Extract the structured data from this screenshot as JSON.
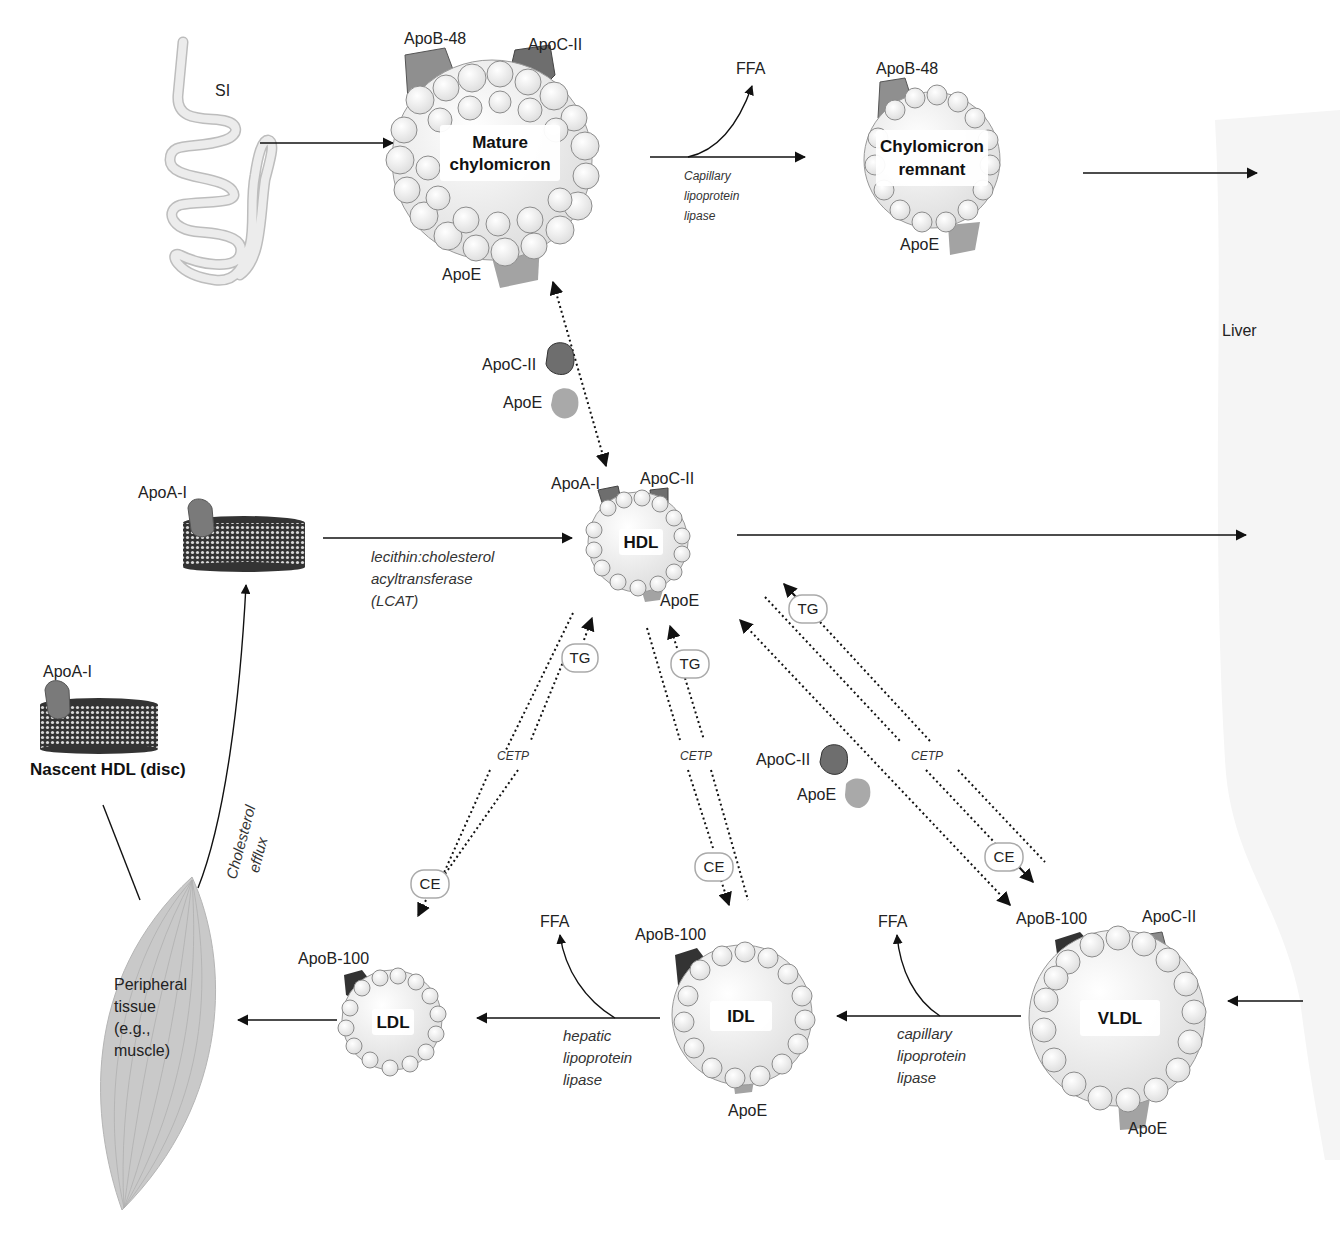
{
  "organs": {
    "small_intestine": "SI",
    "liver": "Liver",
    "peripheral_tissue": [
      "Peripheral",
      "tissue",
      "(e.g.,",
      "muscle)"
    ]
  },
  "particles": {
    "mature_chylomicron": {
      "title": [
        "Mature",
        "chylomicron"
      ],
      "apo_b": "ApoB-48",
      "apo_c": "ApoC-II",
      "apo_e": "ApoE"
    },
    "chylomicron_remnant": {
      "title": [
        "Chylomicron",
        "remnant"
      ],
      "apo_b": "ApoB-48",
      "apo_e": "ApoE"
    },
    "hdl": {
      "title": "HDL",
      "apo_a": "ApoA-I",
      "apo_c": "ApoC-II",
      "apo_e": "ApoE"
    },
    "nascent_hdl": {
      "title": "Nascent HDL (disc)",
      "apo_a": "ApoA-I"
    },
    "disc_hdl_upper": {
      "apo_a": "ApoA-I"
    },
    "ldl": {
      "title": "LDL",
      "apo_b": "ApoB-100"
    },
    "idl": {
      "title": "IDL",
      "apo_b": "ApoB-100",
      "apo_e": "ApoE"
    },
    "vldl": {
      "title": "VLDL",
      "apo_b": "ApoB-100",
      "apo_c": "ApoC-II",
      "apo_e": "ApoE"
    }
  },
  "free_apos": {
    "upper": {
      "apo_c": "ApoC-II",
      "apo_e": "ApoE"
    },
    "lower": {
      "apo_c": "ApoC-II",
      "apo_e": "ApoE"
    }
  },
  "enzymes": {
    "capillary_lpl_top": [
      "Capillary",
      "lipoprotein",
      "lipase"
    ],
    "lcat": [
      "lecithin:cholesterol",
      "acyltransferase",
      "(LCAT)"
    ],
    "hepatic_lpl": [
      "hepatic",
      "lipoprotein",
      "lipase"
    ],
    "capillary_lpl_bottom": [
      "capillary",
      "lipoprotein",
      "lipase"
    ],
    "cetp": "CETP",
    "cholesterol_efflux": [
      "Cholesterol",
      "efflux"
    ]
  },
  "exchange_labels": {
    "tg": "TG",
    "ce": "CE",
    "ffa": "FFA"
  },
  "colors": {
    "apo_dark": "#4a4a4a",
    "apo_mid": "#8a8a8a",
    "apo_light": "#a9a9a9",
    "apo_b100": "#333333",
    "tissue": "#c9c9c9",
    "liver_bg": "#f6f6f6",
    "sphere_fill": "#f4f4f4",
    "sphere_stroke": "#8c8c8c"
  }
}
